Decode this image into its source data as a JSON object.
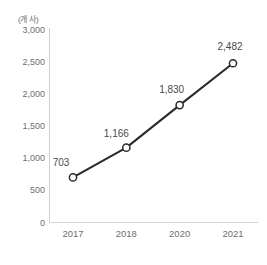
{
  "chart_data": {
    "type": "line",
    "title": "",
    "subtitle": "",
    "unit_label": "(개 사)",
    "xlabel": "",
    "ylabel": "",
    "categories": [
      "2017",
      "2018",
      "2020",
      "2021"
    ],
    "values": [
      703,
      1166,
      1830,
      2482
    ],
    "data_labels": [
      "703",
      "1,166",
      "1,830",
      "2,482"
    ],
    "ylim": [
      0,
      3000
    ],
    "yticks": [
      0,
      500,
      1000,
      1500,
      2000,
      2500,
      3000
    ],
    "ytick_labels": [
      "0",
      "500",
      "1,000",
      "1,500",
      "2,000",
      "2,500",
      "3,000"
    ],
    "grid": false,
    "legend": "none",
    "series": [
      {
        "name": "",
        "values": [
          703,
          1166,
          1830,
          2482
        ],
        "line_color": "#2b2b2b",
        "marker": "open-circle",
        "marker_fill": "#ffffff",
        "marker_edge": "#2b2b2b"
      }
    ]
  },
  "colors": {
    "line": "#2b2b2b",
    "marker_fill": "#ffffff",
    "marker_edge": "#2b2b2b",
    "axis": "#c9c9c9",
    "tick_text": "#6e6e6e",
    "label_text": "#4a4a4a",
    "background": "#ffffff"
  }
}
